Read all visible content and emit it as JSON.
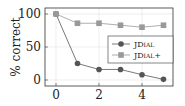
{
  "chart_data": {
    "type": "line",
    "title": "",
    "xlabel": "",
    "ylabel": "% correct",
    "x": [
      0,
      1,
      2,
      3,
      4,
      5
    ],
    "xticks": [
      "0",
      "2",
      "4"
    ],
    "yticks": [
      "0",
      "50",
      "100"
    ],
    "xlim": [
      -0.5,
      5.5
    ],
    "ylim": [
      -8,
      108
    ],
    "grid": true,
    "legend_position": "center right",
    "series": [
      {
        "name": "JDial",
        "marker": "circle",
        "color": "#555555",
        "values": [
          100,
          25,
          16,
          16,
          8,
          1
        ]
      },
      {
        "name": "JDial+",
        "marker": "square",
        "color": "#999999",
        "values": [
          100,
          86,
          86,
          83,
          80,
          83
        ]
      }
    ]
  }
}
